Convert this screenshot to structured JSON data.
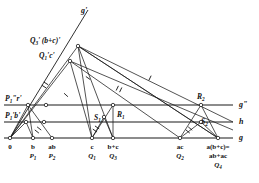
{
  "figure": {
    "stroke_color": "#1a1a1a",
    "node_fill": "#ffffff"
  },
  "axes": [
    {
      "name": "g-prime",
      "label": "g'",
      "x": 81,
      "y": 13
    },
    {
      "name": "g-double",
      "label": "g\"",
      "x": 239,
      "y": 107
    },
    {
      "name": "h",
      "label": "h",
      "x": 239,
      "y": 124
    },
    {
      "name": "g",
      "label": "g",
      "x": 239,
      "y": 140
    }
  ],
  "lines": {
    "g": {
      "x1": 4,
      "y1": 138,
      "x2": 233,
      "y2": 138
    },
    "h": {
      "x1": 4,
      "y1": 122,
      "x2": 233,
      "y2": 122
    },
    "g2": {
      "x1": 4,
      "y1": 105,
      "x2": 233,
      "y2": 105
    },
    "g1": {
      "x1": 10,
      "y1": 138,
      "x2": 88,
      "y2": 10
    }
  },
  "base_points": [
    {
      "name": "origin",
      "x": 10,
      "top": "0",
      "mid": "",
      "bot": ""
    },
    {
      "name": "b",
      "x": 33,
      "top": "b",
      "mid": "P",
      "sub": "1"
    },
    {
      "name": "ab",
      "x": 52,
      "top": "ab",
      "mid": "P",
      "sub": "2"
    },
    {
      "name": "c",
      "x": 92,
      "top": "c",
      "mid": "Q",
      "sub": "1"
    },
    {
      "name": "b-plus-c",
      "x": 113,
      "top": "b+c",
      "mid": "Q",
      "sub": "3"
    },
    {
      "name": "ac",
      "x": 180,
      "top": "ac",
      "mid": "Q",
      "sub": "2"
    },
    {
      "name": "a-b-plus-c",
      "x": 218,
      "top": "a(b+c)=",
      "mid2": "ab+ac",
      "mid": "Q",
      "sub": "4"
    }
  ],
  "point_labels": [
    {
      "name": "q3-bc-prime",
      "text": "Q",
      "sub": "3",
      "tail": "' (b+c)'",
      "x": 30,
      "y": 43,
      "px": 78,
      "py": 46
    },
    {
      "name": "q1-c-prime",
      "text": "Q",
      "sub": "1",
      "tail": "'c'",
      "x": 39,
      "y": 58,
      "px": 70,
      "py": 61
    },
    {
      "name": "p1-r-prime",
      "text": "P",
      "sub": "1",
      "tail": "\"r'",
      "x": 5,
      "y": 101,
      "px": 28,
      "py": 105
    },
    {
      "name": "p1-b-prime",
      "text": "P",
      "sub": "1",
      "tail": "'b'",
      "x": 5,
      "y": 118,
      "px": 26,
      "py": 122
    },
    {
      "name": "s1",
      "text": "S",
      "sub": "1",
      "tail": "",
      "x": 94,
      "y": 120,
      "px": 104,
      "py": 117
    },
    {
      "name": "r1",
      "text": "R",
      "sub": "1",
      "tail": "",
      "x": 117,
      "y": 117,
      "px": 113,
      "py": 110
    },
    {
      "name": "s2",
      "text": "S",
      "sub": "2",
      "tail": "",
      "x": 201,
      "y": 124,
      "px": 201,
      "py": 121
    },
    {
      "name": "r2",
      "text": "R",
      "sub": "2",
      "tail": "",
      "x": 197,
      "y": 99,
      "px": 200,
      "py": 105
    }
  ],
  "nodes": [
    {
      "name": "node-0",
      "x": 10,
      "y": 138
    },
    {
      "name": "node-b",
      "x": 33,
      "y": 138
    },
    {
      "name": "node-ab",
      "x": 52,
      "y": 138
    },
    {
      "name": "node-c",
      "x": 92,
      "y": 138
    },
    {
      "name": "node-bc",
      "x": 113,
      "y": 138
    },
    {
      "name": "node-ac",
      "x": 180,
      "y": 138
    },
    {
      "name": "node-abc",
      "x": 218,
      "y": 138
    },
    {
      "name": "node-p1b",
      "x": 26,
      "y": 122
    },
    {
      "name": "node-p1r",
      "x": 28,
      "y": 105
    },
    {
      "name": "node-s1",
      "x": 104,
      "y": 117
    },
    {
      "name": "node-r1",
      "x": 113,
      "y": 105
    },
    {
      "name": "node-s2",
      "x": 201,
      "y": 122
    },
    {
      "name": "node-r2",
      "x": 201,
      "y": 105
    },
    {
      "name": "node-q1c",
      "x": 70,
      "y": 61
    },
    {
      "name": "node-q3bc",
      "x": 78,
      "y": 46
    },
    {
      "name": "node-h-left",
      "x": 44,
      "y": 122
    },
    {
      "name": "node-g2-left",
      "x": 46,
      "y": 105
    }
  ],
  "segments": [
    {
      "name": "seg-0-q3",
      "x1": 10,
      "y1": 138,
      "x2": 78,
      "y2": 46
    },
    {
      "name": "seg-q1c-0",
      "x1": 70,
      "y1": 61,
      "x2": 10,
      "y2": 138
    },
    {
      "name": "seg-q3-ac",
      "x1": 78,
      "y1": 46,
      "x2": 218,
      "y2": 138
    },
    {
      "name": "seg-q3-abc",
      "x1": 78,
      "y1": 46,
      "x2": 218,
      "y2": 138
    },
    {
      "name": "seg-q3-c",
      "x1": 78,
      "y1": 46,
      "x2": 92,
      "y2": 138
    },
    {
      "name": "seg-q3-bc",
      "x1": 78,
      "y1": 46,
      "x2": 113,
      "y2": 138
    },
    {
      "name": "seg-q1c-c",
      "x1": 70,
      "y1": 61,
      "x2": 92,
      "y2": 138
    },
    {
      "name": "seg-q1c-ac",
      "x1": 70,
      "y1": 61,
      "x2": 180,
      "y2": 138
    },
    {
      "name": "seg-q1c-right",
      "x1": 70,
      "y1": 61,
      "x2": 233,
      "y2": 130
    },
    {
      "name": "seg-q3-right",
      "x1": 78,
      "y1": 46,
      "x2": 233,
      "y2": 122
    },
    {
      "name": "seg-p1b-b",
      "x1": 26,
      "y1": 122,
      "x2": 33,
      "y2": 138
    },
    {
      "name": "seg-p1b-0",
      "x1": 26,
      "y1": 122,
      "x2": 10,
      "y2": 138
    },
    {
      "name": "seg-p1r-ab",
      "x1": 28,
      "y1": 105,
      "x2": 52,
      "y2": 138
    },
    {
      "name": "seg-p1r-b",
      "x1": 28,
      "y1": 105,
      "x2": 33,
      "y2": 138
    },
    {
      "name": "seg-p1r-0",
      "x1": 28,
      "y1": 105,
      "x2": 10,
      "y2": 138
    },
    {
      "name": "seg-s1-c",
      "x1": 104,
      "y1": 117,
      "x2": 92,
      "y2": 138
    },
    {
      "name": "seg-s1-bc",
      "x1": 104,
      "y1": 117,
      "x2": 113,
      "y2": 138
    },
    {
      "name": "seg-r1-c",
      "x1": 113,
      "y1": 105,
      "x2": 92,
      "y2": 138
    },
    {
      "name": "seg-r1-bc",
      "x1": 113,
      "y1": 105,
      "x2": 113,
      "y2": 138
    },
    {
      "name": "seg-s2-ac",
      "x1": 201,
      "y1": 122,
      "x2": 180,
      "y2": 138
    },
    {
      "name": "seg-s2-abc",
      "x1": 201,
      "y1": 122,
      "x2": 218,
      "y2": 138
    },
    {
      "name": "seg-r2-ac",
      "x1": 201,
      "y1": 105,
      "x2": 180,
      "y2": 138
    },
    {
      "name": "seg-r2-abc",
      "x1": 201,
      "y1": 105,
      "x2": 218,
      "y2": 138
    }
  ],
  "tick_marks": [
    {
      "name": "tick-double-1",
      "x": 45,
      "y": 85,
      "a": -58,
      "n": 2
    },
    {
      "name": "tick-single-1",
      "x": 66,
      "y": 95,
      "a": -48,
      "n": 1
    },
    {
      "name": "tick-single-2",
      "x": 88,
      "y": 78,
      "a": -55,
      "n": 1
    },
    {
      "name": "tick-double-2",
      "x": 119,
      "y": 89,
      "a": 26,
      "n": 2
    },
    {
      "name": "tick-single-3",
      "x": 150,
      "y": 78,
      "a": 26,
      "n": 1
    },
    {
      "name": "tick-double-3",
      "x": 38,
      "y": 130,
      "a": -52,
      "n": 2
    },
    {
      "name": "tick-double-4",
      "x": 96,
      "y": 129,
      "a": -55,
      "n": 2
    },
    {
      "name": "tick-double-5",
      "x": 189,
      "y": 130,
      "a": -50,
      "n": 2
    }
  ]
}
